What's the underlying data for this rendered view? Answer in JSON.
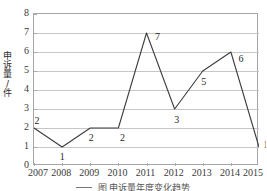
{
  "chart_data": {
    "type": "line",
    "title": "",
    "subtitle": "",
    "xlabel": "",
    "ylabel": "申诉量/件",
    "categories": [
      "2007",
      "2008",
      "2009",
      "2010",
      "2011",
      "2012",
      "2013",
      "2014",
      "2015"
    ],
    "values": [
      2,
      1,
      2,
      2,
      7,
      3,
      5,
      6,
      1
    ],
    "point_labels": [
      "2",
      "1",
      "2",
      "2",
      "7",
      "3",
      "5",
      "6",
      "1"
    ],
    "series": [
      {
        "name": "申诉量",
        "values": [
          2,
          1,
          2,
          2,
          7,
          3,
          5,
          6,
          1
        ]
      }
    ],
    "ylim": [
      0,
      8
    ],
    "y_ticks": [
      0,
      1,
      2,
      3,
      4,
      5,
      6,
      7,
      8
    ],
    "y_tick_labels": [
      "0",
      "1",
      "2",
      "3",
      "4",
      "5",
      "6",
      "7",
      "8"
    ],
    "grid": "horizontal",
    "legend": "none",
    "markers": "none",
    "line_color": "#3d3d3d",
    "grid_color": "#bfbfbf",
    "axis_color": "#a6a6a6",
    "text_color": "#2b2b2b"
  },
  "axes": {
    "y_title_chars": "申\n诉\n量\n/\n件"
  },
  "caption": {
    "text": "图  申诉量年度变化趋势"
  }
}
